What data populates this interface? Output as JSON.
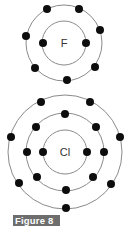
{
  "figure": {
    "label": "Figure 8",
    "label_bg": "#6e6e6e",
    "electron_color": "#0d0d0d",
    "shell_color": "#8a8a8a"
  },
  "atoms": [
    {
      "symbol": "F",
      "shells": [
        {
          "electrons": 2
        },
        {
          "electrons": 7
        }
      ]
    },
    {
      "symbol": "Cl",
      "shells": [
        {
          "electrons": 2
        },
        {
          "electrons": 8
        },
        {
          "electrons": 7
        }
      ]
    }
  ]
}
